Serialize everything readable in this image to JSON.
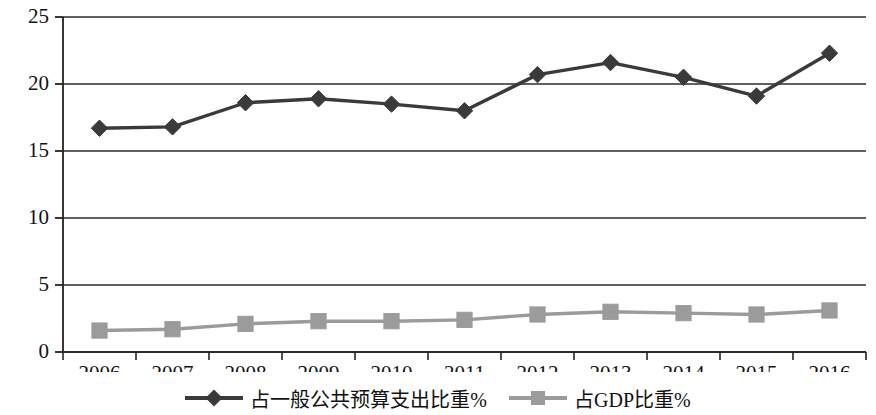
{
  "chart_data": {
    "type": "line",
    "title": "",
    "subtitle": "",
    "xlabel": "",
    "ylabel": "",
    "categories": [
      "2006",
      "2007",
      "2008",
      "2009",
      "2010",
      "2011",
      "2012",
      "2013",
      "2014",
      "2015",
      "2016"
    ],
    "ylim": [
      0,
      25
    ],
    "ytick_labels": [
      "0",
      "5",
      "10",
      "15",
      "20",
      "25"
    ],
    "ytick_values": [
      0,
      5,
      10,
      15,
      20,
      25
    ],
    "grid": "horizontal",
    "legend_position": "bottom-center",
    "series": [
      {
        "name": "占一般公共预算支出比重%",
        "marker": "diamond",
        "color": "#3a3a3a",
        "values": [
          16.7,
          16.8,
          18.6,
          18.9,
          18.5,
          18.0,
          20.7,
          21.6,
          20.5,
          19.1,
          22.3
        ]
      },
      {
        "name": "占GDP比重%",
        "marker": "square",
        "color": "#9b9b9b",
        "values": [
          1.6,
          1.7,
          2.1,
          2.3,
          2.3,
          2.4,
          2.8,
          3.0,
          2.9,
          2.8,
          3.1
        ]
      }
    ]
  },
  "colors": {
    "series_1": "#3a3a3a",
    "series_2": "#9b9b9b",
    "axis": "#222222",
    "grid": "#2b2b2b",
    "background": "#ffffff"
  },
  "legend": {
    "items": [
      {
        "label": "占一般公共预算支出比重%",
        "marker": "diamond-line-marker"
      },
      {
        "label": "占GDP比重%",
        "marker": "square-line-marker"
      }
    ]
  }
}
